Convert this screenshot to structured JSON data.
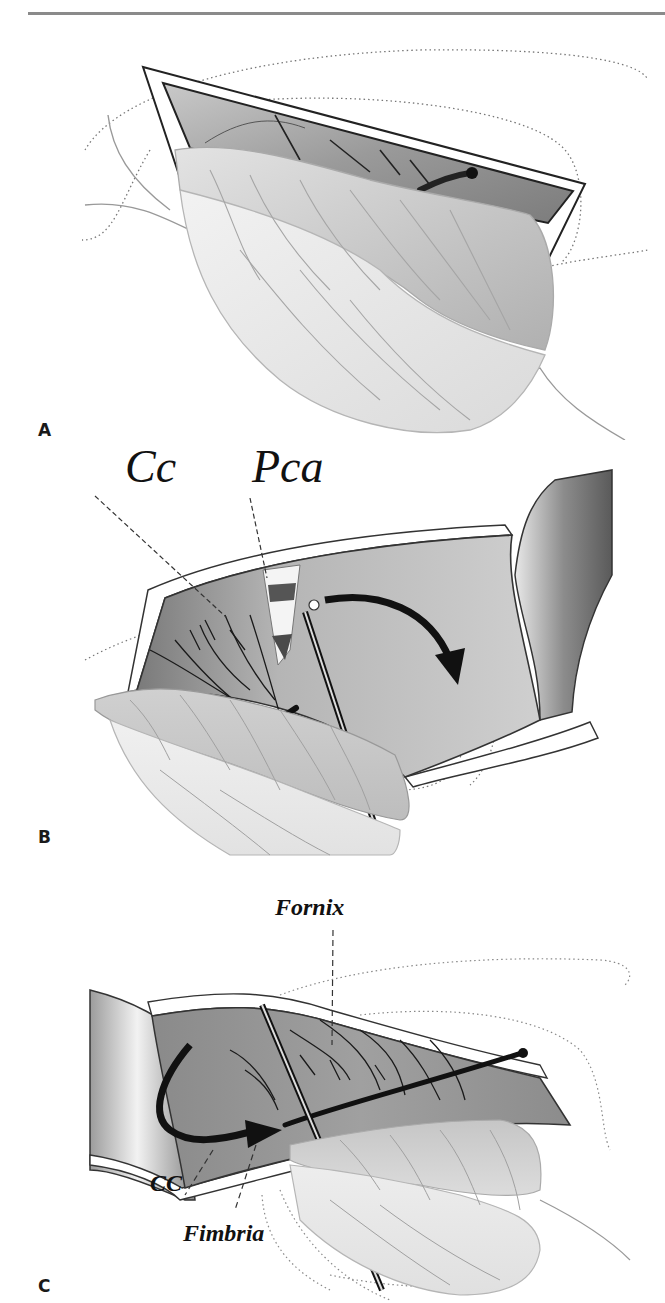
{
  "page": {
    "running_header_visible_fragment": "",
    "header_rule_color": "#8a8a8a"
  },
  "figure": {
    "panels": [
      {
        "letter": "A",
        "labels": []
      },
      {
        "letter": "B",
        "labels": [
          {
            "text": "Cc"
          },
          {
            "text": "Pca"
          }
        ]
      },
      {
        "letter": "C",
        "labels": [
          {
            "text": "Fornix"
          },
          {
            "text": "CC"
          },
          {
            "text": "Fimbria"
          }
        ]
      }
    ],
    "colors": {
      "ink": "#1a1a1a",
      "cavity_dark": "#6e6e6e",
      "cavity_mid": "#a6a6a6",
      "tissue_light": "#d9d9d9",
      "tissue_pale": "#ececec",
      "paper": "#ffffff"
    }
  }
}
